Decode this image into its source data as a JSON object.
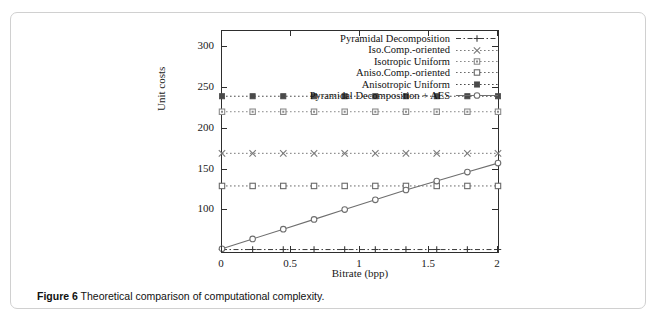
{
  "figure": {
    "caption_label": "Figure 6",
    "caption_text": "Theoretical comparison of computational complexity."
  },
  "chart_data": {
    "type": "line",
    "title": "",
    "xlabel": "Bitrate (bpp)",
    "ylabel": "Unit costs",
    "xlim": [
      0,
      2
    ],
    "ylim": [
      49,
      320
    ],
    "xticks": [
      "0",
      "0.5",
      "1",
      "1.5",
      "2"
    ],
    "xtick_values": [
      0,
      0.5,
      1,
      1.5,
      2
    ],
    "yticks": [
      "100",
      "150",
      "200",
      "250",
      "300"
    ],
    "ytick_values": [
      100,
      150,
      200,
      250,
      300
    ],
    "grid": false,
    "legend_position": "top-right inside",
    "x": [
      0,
      0.222,
      0.444,
      0.667,
      0.889,
      1.111,
      1.333,
      1.556,
      1.778,
      2.0
    ],
    "series": [
      {
        "name": "Pyramidal Decomposition",
        "marker": "plus",
        "linestyle": "dashed",
        "color": "#3a3a3a",
        "values": [
          52,
          52,
          52,
          52,
          52,
          52,
          52,
          52,
          52,
          52
        ]
      },
      {
        "name": "Iso.Comp.-oriented",
        "marker": "cross",
        "linestyle": "dotted",
        "color": "#7a7a7a",
        "values": [
          170,
          170,
          170,
          170,
          170,
          170,
          170,
          170,
          170,
          170
        ]
      },
      {
        "name": "Isotropic Uniform",
        "marker": "square-dotted",
        "linestyle": "dotted",
        "color": "#8a8a8a",
        "values": [
          221,
          221,
          221,
          221,
          221,
          221,
          221,
          221,
          221,
          221
        ]
      },
      {
        "name": "Aniso.Comp.-oriented",
        "marker": "square-open",
        "linestyle": "dotted",
        "color": "#6a6a6a",
        "values": [
          130,
          130,
          130,
          130,
          130,
          130,
          130,
          130,
          130,
          130
        ]
      },
      {
        "name": "Anisotropic Uniform",
        "marker": "square-filled",
        "linestyle": "dotted",
        "color": "#4a4a4a",
        "values": [
          240,
          240,
          240,
          240,
          240,
          240,
          240,
          240,
          240,
          240
        ]
      },
      {
        "name": "Pyramidal Decomposition + AES",
        "marker": "circle-open",
        "linestyle": "solid",
        "color": "#6e6e6e",
        "values": [
          53,
          65,
          77,
          89,
          101,
          113,
          125,
          136,
          147,
          158
        ]
      }
    ]
  }
}
